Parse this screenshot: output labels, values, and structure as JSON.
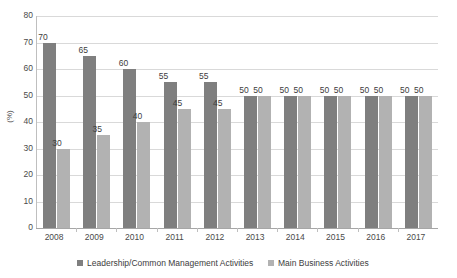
{
  "chart_data": {
    "type": "bar",
    "title": "",
    "subtitle": "",
    "xlabel": "",
    "ylabel": "(%)",
    "ylim": [
      0,
      80
    ],
    "ytick_step": 10,
    "yticks": [
      "80",
      "70",
      "60",
      "50",
      "40",
      "30",
      "20",
      "10",
      "0"
    ],
    "grid": true,
    "legend_position": "bottom",
    "categories": [
      "2008",
      "2009",
      "2010",
      "2011",
      "2012",
      "2013",
      "2014",
      "2015",
      "2016",
      "2017"
    ],
    "series": [
      {
        "name": "Leadership/Common Management Activities",
        "color": "#7f7f7f",
        "values": [
          70,
          65,
          60,
          55,
          55,
          50,
          50,
          50,
          50,
          50
        ]
      },
      {
        "name": "Main Business Activities",
        "color": "#b2b2b2",
        "values": [
          30,
          35,
          40,
          45,
          45,
          50,
          50,
          50,
          50,
          50
        ]
      }
    ],
    "data_labels": true
  },
  "axes": {
    "y_title": "(%)"
  },
  "legend": {
    "items": [
      {
        "label": "Leadership/Common Management Activities",
        "color": "#7f7f7f"
      },
      {
        "label": "Main Business Activities",
        "color": "#b2b2b2"
      }
    ]
  }
}
